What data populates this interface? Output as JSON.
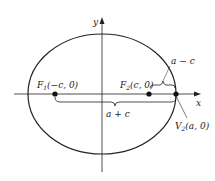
{
  "diagram": {
    "type": "ellipse-foci",
    "colors": {
      "stroke": "#222222",
      "background": "#ffffff"
    },
    "axes": {
      "x_label": "x",
      "y_label": "y"
    },
    "points": [
      {
        "id": "F1",
        "label_main": "F",
        "label_sub": "1",
        "label_coords": "(−c, 0)"
      },
      {
        "id": "F2",
        "label_main": "F",
        "label_sub": "2",
        "label_coords": "(c, 0)"
      },
      {
        "id": "V2",
        "label_main": "V",
        "label_sub": "2",
        "label_coords": "(a, 0)"
      }
    ],
    "braces": [
      {
        "id": "a-plus-c",
        "label": "a + c"
      },
      {
        "id": "a-minus-c",
        "label": "a − c"
      }
    ]
  }
}
